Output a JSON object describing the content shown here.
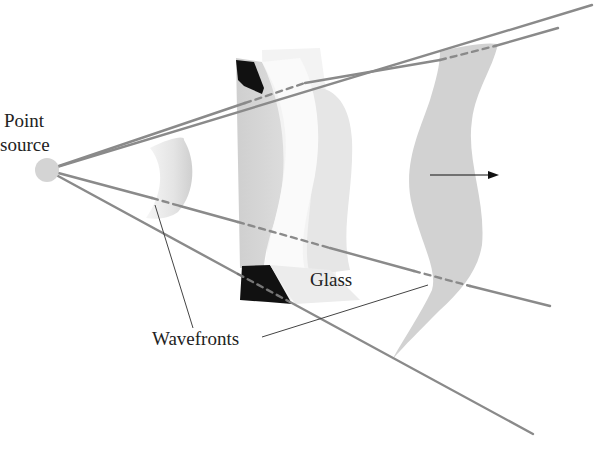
{
  "figure": {
    "labels": {
      "point_source_line1": "Point",
      "point_source_line2": "source",
      "glass": "Glass",
      "wavefronts": "Wavefronts"
    },
    "colors": {
      "background": "#ffffff",
      "ray": "#8a8a8a",
      "point_source": "#d4d4d4",
      "wavefront_light": "#ececec",
      "wavefront_mid": "#d2d2d2",
      "glass_dark": "#111111",
      "label_text": "#222222",
      "leader_line": "#444444",
      "propagation_arrow": "#111111"
    },
    "elements": [
      "point-source",
      "rays",
      "spherical-wavefront",
      "glass-block",
      "distorted-wavefront",
      "propagation-direction-arrow"
    ]
  }
}
